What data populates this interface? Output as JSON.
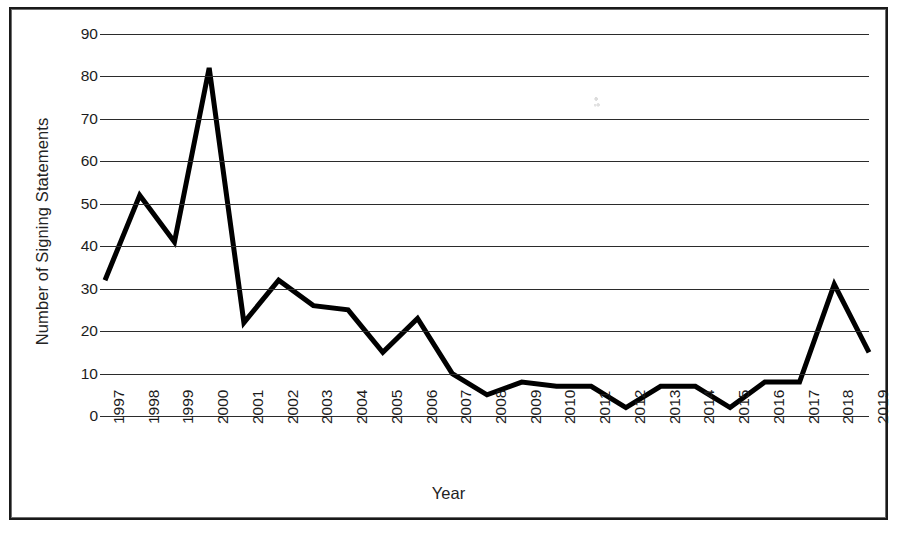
{
  "chart_data": {
    "type": "line",
    "title": "",
    "xlabel": "Year",
    "ylabel": "Number of Signing Statements",
    "grid": true,
    "legend": false,
    "legend_position": "none",
    "xlim": [
      1997,
      2019
    ],
    "ylim": [
      0,
      90
    ],
    "ytick_interval": 10,
    "yticks": [
      0,
      10,
      20,
      30,
      40,
      50,
      60,
      70,
      80,
      90
    ],
    "ytick_labels": [
      "0",
      "10",
      "20",
      "30",
      "40",
      "50",
      "60",
      "70",
      "80",
      "90"
    ],
    "categories": [
      "1997",
      "1998",
      "1999",
      "2000",
      "2001",
      "2002",
      "2003",
      "2004",
      "2005",
      "2006",
      "2007",
      "2008",
      "2009",
      "2010",
      "2011",
      "2012",
      "2013",
      "2014",
      "2015",
      "2016",
      "2017",
      "2018",
      "2019"
    ],
    "values": [
      32,
      52,
      41,
      82,
      22,
      32,
      26,
      25,
      15,
      23,
      10,
      5,
      8,
      7,
      7,
      2,
      7,
      7,
      2,
      8,
      8,
      31,
      15
    ],
    "series": [
      {
        "name": "Number of Signing Statements",
        "color": "#000000",
        "values": [
          32,
          52,
          41,
          82,
          22,
          32,
          26,
          25,
          15,
          23,
          10,
          5,
          8,
          7,
          7,
          2,
          7,
          7,
          2,
          8,
          8,
          31,
          15
        ]
      }
    ],
    "line_color": "#000000",
    "line_width": 5,
    "grid_color": "#2b2b2b",
    "background_color": "#ffffff",
    "border_color": "#1a1a1a",
    "markers": false
  }
}
